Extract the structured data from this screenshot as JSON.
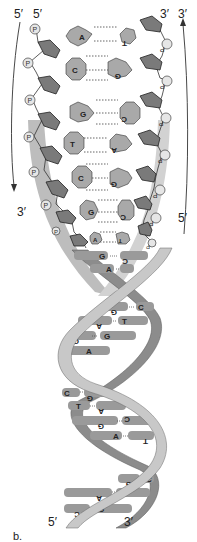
{
  "figure": {
    "panel_label": "b.",
    "colors": {
      "sugar_fill": "#7a7a7a",
      "base_fill": "#a9a9a9",
      "phosphate_fill": "#e6e6e6",
      "ribbon_light": "#c8c8c8",
      "ribbon_dark": "#8c8c8c",
      "rung": "#9a9a9a"
    }
  },
  "strand_labels": {
    "top_left_outer": "5′",
    "top_left_inner": "5′",
    "top_right_inner": "3′",
    "top_right_outer": "3′",
    "left_arrow_end": "3′",
    "right_arrow_start": "5′",
    "bottom_left": "5′",
    "bottom_right": "3′"
  },
  "phosphate_label": "P",
  "ladder_pairs": [
    {
      "left": "A",
      "right": "T",
      "hbonds": 2
    },
    {
      "left": "C",
      "right": "G",
      "hbonds": 3
    },
    {
      "left": "G",
      "right": "C",
      "hbonds": 3
    },
    {
      "left": "T",
      "right": "A",
      "hbonds": 2
    },
    {
      "left": "C",
      "right": "G",
      "hbonds": 3
    },
    {
      "left": "G",
      "right": "C",
      "hbonds": 3
    },
    {
      "left": "A",
      "right": "T",
      "hbonds": 2
    }
  ],
  "helix_pairs": [
    {
      "left": "G",
      "right": "C"
    },
    {
      "left": "A",
      "right": "T"
    },
    {
      "left": "G",
      "right": "C"
    },
    {
      "left": "A",
      "right": "T"
    },
    {
      "left": "C",
      "right": "G"
    },
    {
      "left": "T",
      "right": "A"
    },
    {
      "left": "C",
      "right": "G"
    },
    {
      "left": "T",
      "right": "A"
    },
    {
      "left": "G",
      "right": "C"
    },
    {
      "left": "A",
      "right": "T"
    },
    {
      "left": "G",
      "right": "C"
    },
    {
      "left": "A",
      "right": "T"
    },
    {
      "left": "C",
      "right": "G"
    }
  ]
}
